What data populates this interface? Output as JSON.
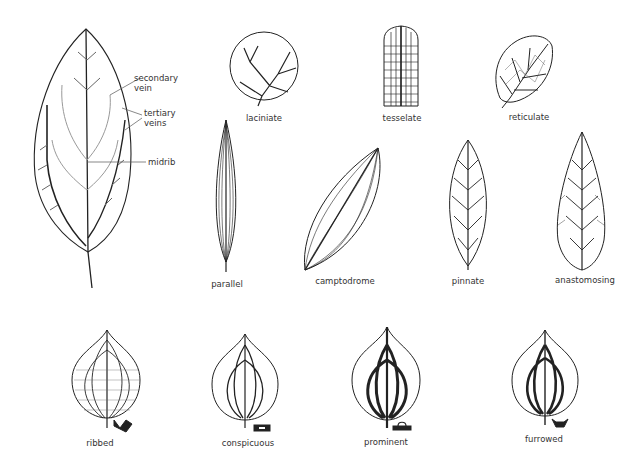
{
  "diagram": {
    "annotated_leaf": {
      "callouts": [
        "secondary vein",
        "tertiary veins",
        "midrib"
      ],
      "callout_lines": {
        "secondary": [
          "secondary",
          "vein"
        ],
        "tertiary": [
          "tertiary",
          "veins"
        ],
        "midrib": [
          "midrib"
        ]
      }
    },
    "venation_types": [
      {
        "label": "laciniate"
      },
      {
        "label": "tesselate"
      },
      {
        "label": "reticulate"
      },
      {
        "label": "parallel"
      },
      {
        "label": "camptodrome"
      },
      {
        "label": "pinnate"
      },
      {
        "label": "anastomosing"
      }
    ],
    "vein_profiles": [
      {
        "label": "ribbed"
      },
      {
        "label": "conspicuous"
      },
      {
        "label": "prominent"
      },
      {
        "label": "furrowed"
      }
    ],
    "colors": {
      "ink": "#222222",
      "background": "#ffffff"
    }
  }
}
